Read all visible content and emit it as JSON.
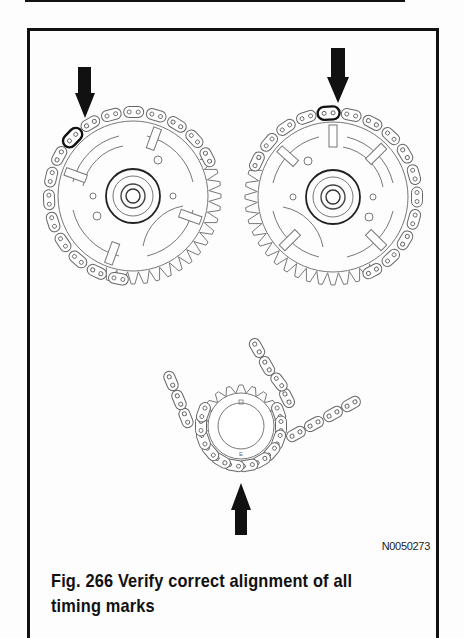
{
  "figure": {
    "id_code": "N0050273",
    "caption": "Fig. 266  Verify correct alignment of all timing marks",
    "caption_line1": "Fig. 266  Verify correct alignment of all",
    "caption_line2": "timing marks",
    "number": "266"
  },
  "diagram": {
    "components": [
      {
        "name": "left-camshaft-sprocket",
        "marker": "arrow pointing to highlighted chain link (upper-left)"
      },
      {
        "name": "right-camshaft-sprocket",
        "marker": "arrow pointing to highlighted chain link (top)"
      },
      {
        "name": "crankshaft-sprocket",
        "marker": "arrow pointing up to highlighted chain link (bottom)"
      }
    ],
    "colors": {
      "line": "#111111",
      "background": "#fdfdfd"
    }
  }
}
